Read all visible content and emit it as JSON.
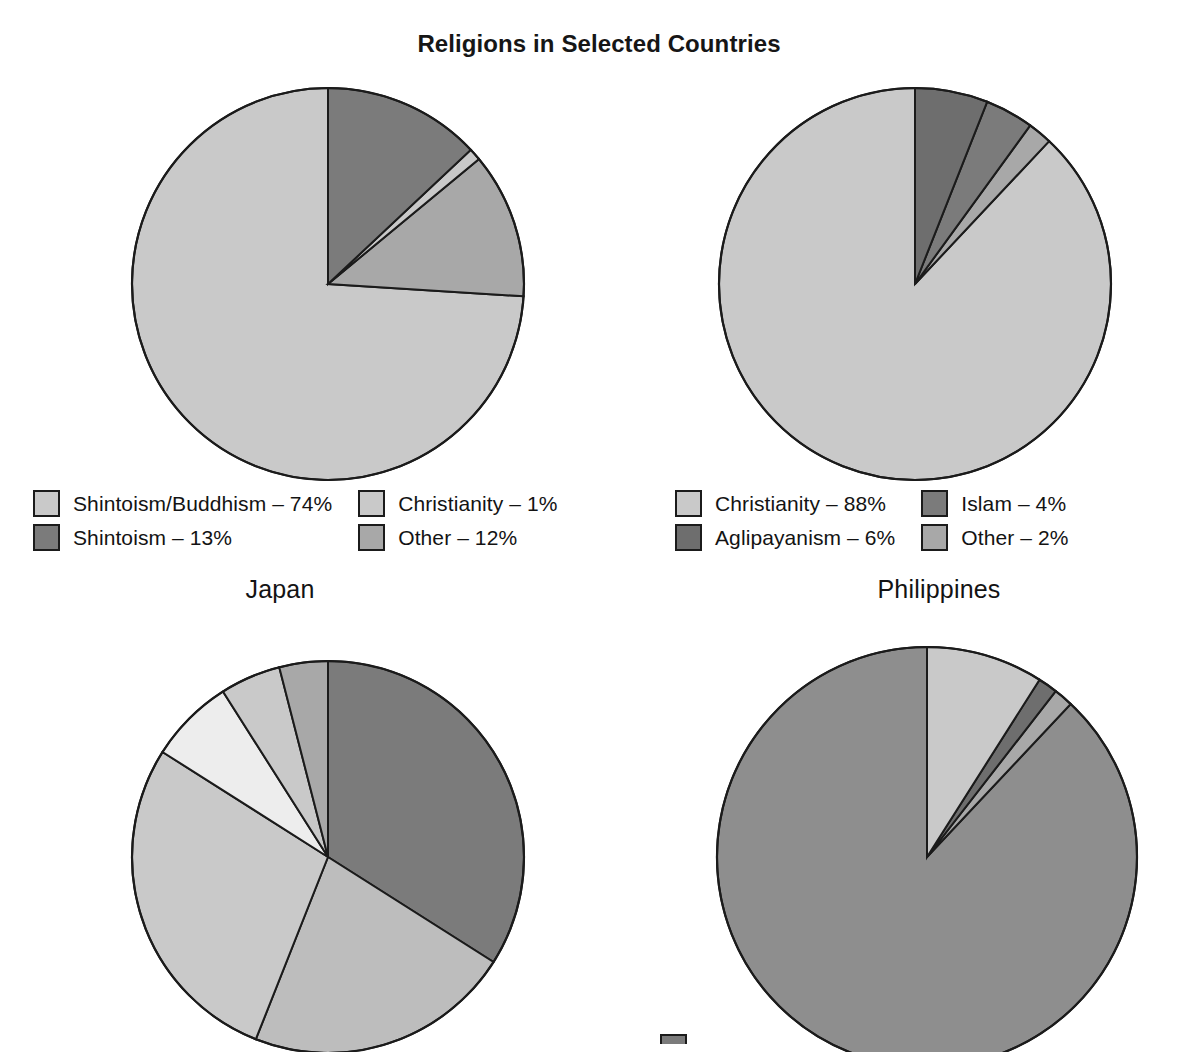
{
  "figure": {
    "title": "Religions in Selected Countries",
    "background": "#ffffff",
    "outline_color": "#1b1b1b"
  },
  "palette": {
    "very_light": "#ededed",
    "light": "#c9c9c9",
    "light_mid": "#bdbdbd",
    "mid": "#a8a8a8",
    "mid_dark": "#8e8e8e",
    "dark": "#7b7b7b",
    "darker": "#6e6e6e",
    "darkest": "#5f5f5f"
  },
  "panels": {
    "japan": {
      "country": "Japan",
      "legend": [
        {
          "label": "Shintoism/Buddhism – 74%",
          "color": "#c9c9c9"
        },
        {
          "label": "Christianity – 1%",
          "color": "#c9c9c9"
        },
        {
          "label": "Shintoism – 13%",
          "color": "#7b7b7b"
        },
        {
          "label": "Other – 12%",
          "color": "#a8a8a8"
        }
      ]
    },
    "philippines": {
      "country": "Philippines",
      "legend": [
        {
          "label": "Christianity – 88%",
          "color": "#c9c9c9"
        },
        {
          "label": "Islam – 4%",
          "color": "#7b7b7b"
        },
        {
          "label": "Aglipayanism – 6%",
          "color": "#6e6e6e"
        },
        {
          "label": "Other – 2%",
          "color": "#a8a8a8"
        }
      ]
    }
  },
  "chart_data": [
    {
      "type": "pie",
      "title": "Japan",
      "start_angle_deg": 90,
      "direction": "counterclockwise",
      "labels": [
        "Shintoism/Buddhism",
        "Other",
        "Christianity",
        "Shintoism"
      ],
      "values": [
        74,
        12,
        1,
        13
      ],
      "display_labels": [
        "Shintoism/Buddhism – 74%",
        "Other – 12%",
        "Christianity – 1%",
        "Shintoism – 13%"
      ],
      "colors": [
        "#c9c9c9",
        "#a8a8a8",
        "#c9c9c9",
        "#7b7b7b"
      ],
      "legend_position": "below"
    },
    {
      "type": "pie",
      "title": "Philippines",
      "start_angle_deg": 90,
      "direction": "counterclockwise",
      "labels": [
        "Christianity",
        "Other",
        "Islam",
        "Aglipayanism"
      ],
      "values": [
        88,
        2,
        4,
        6
      ],
      "display_labels": [
        "Christianity – 88%",
        "Other – 2%",
        "Islam – 4%",
        "Aglipayanism – 6%"
      ],
      "colors": [
        "#c9c9c9",
        "#a8a8a8",
        "#7b7b7b",
        "#6e6e6e"
      ],
      "legend_position": "below"
    },
    {
      "type": "pie",
      "title": "",
      "start_angle_deg": 90,
      "direction": "clockwise",
      "labels": [
        "",
        "",
        "",
        "",
        "",
        ""
      ],
      "values": [
        34,
        22,
        28,
        7,
        5,
        4
      ],
      "display_labels": [
        "",
        "",
        "",
        "",
        "",
        ""
      ],
      "colors": [
        "#7b7b7b",
        "#bdbdbd",
        "#c9c9c9",
        "#ededed",
        "#c9c9c9",
        "#a8a8a8"
      ],
      "legend_position": "cropped"
    },
    {
      "type": "pie",
      "title": "",
      "start_angle_deg": 90,
      "direction": "counterclockwise",
      "labels": [
        "",
        "",
        "",
        ""
      ],
      "values": [
        88,
        1.5,
        1.5,
        9
      ],
      "display_labels": [
        "",
        "",
        "",
        ""
      ],
      "colors": [
        "#8e8e8e",
        "#a8a8a8",
        "#6e6e6e",
        "#c9c9c9"
      ],
      "legend_position": "cropped"
    }
  ]
}
